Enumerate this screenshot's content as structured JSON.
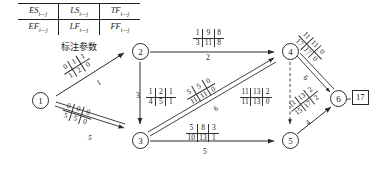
{
  "legend": {
    "caption": "标注参数",
    "cells": [
      [
        "ES",
        "LS",
        "TF"
      ],
      [
        "EF",
        "LF",
        "FF"
      ]
    ],
    "subscript": "i—j"
  },
  "diagram": {
    "type": "cpm-network-diagram",
    "nodes": [
      {
        "id": "1",
        "label": "1",
        "x": 41,
        "y": 101
      },
      {
        "id": "2",
        "label": "2",
        "x": 132,
        "y": 44
      },
      {
        "id": "3",
        "label": "3",
        "x": 132,
        "y": 133
      },
      {
        "id": "4",
        "label": "4",
        "x": 282,
        "y": 44
      },
      {
        "id": "5",
        "label": "5",
        "x": 282,
        "y": 133
      },
      {
        "id": "6",
        "label": "6",
        "x": 332,
        "y": 99
      }
    ],
    "finish_label": "17",
    "activities": [
      {
        "name": "1-2",
        "from": "1",
        "to": "2",
        "ES": "0",
        "LS": "1",
        "TF": "1",
        "EF": "1",
        "LF": "2",
        "FF": "0",
        "duration": "1",
        "critical": false
      },
      {
        "name": "1-3",
        "from": "1",
        "to": "3",
        "ES": "0",
        "LS": "0",
        "TF": "0",
        "EF": "5",
        "LF": "5",
        "FF": "0",
        "duration": "5",
        "critical": true
      },
      {
        "name": "2-3",
        "from": "2",
        "to": "3",
        "ES": "1",
        "LS": "2",
        "TF": "1",
        "EF": "4",
        "LF": "5",
        "FF": "1",
        "duration": "3",
        "critical": false
      },
      {
        "name": "2-4",
        "from": "2",
        "to": "4",
        "ES": "1",
        "LS": "9",
        "TF": "8",
        "EF": "3",
        "LF": "11",
        "FF": "8",
        "duration": "2",
        "critical": false
      },
      {
        "name": "3-4",
        "from": "3",
        "to": "4",
        "ES": "5",
        "LS": "5",
        "TF": "0",
        "EF": "11",
        "LF": "11",
        "FF": "0",
        "duration": "6",
        "critical": true
      },
      {
        "name": "3-5",
        "from": "3",
        "to": "5",
        "ES": "5",
        "LS": "8",
        "TF": "3",
        "EF": "10",
        "LF": "13",
        "FF": "1",
        "duration": "5",
        "critical": false
      },
      {
        "name": "4-5",
        "from": "4",
        "to": "5",
        "ES": "11",
        "LS": "13",
        "TF": "2",
        "EF": "11",
        "LF": "13",
        "FF": "0",
        "duration": "",
        "critical": false,
        "dummy": true
      },
      {
        "name": "4-6",
        "from": "4",
        "to": "6",
        "ES": "11",
        "LS": "11",
        "TF": "0",
        "EF": "17",
        "LF": "17",
        "FF": "0",
        "duration": "6",
        "critical": true
      },
      {
        "name": "5-6",
        "from": "5",
        "to": "6",
        "ES": "11",
        "LS": "13",
        "TF": "2",
        "EF": "15",
        "LF": "17",
        "FF": "2",
        "duration": "4",
        "critical": false
      }
    ]
  }
}
